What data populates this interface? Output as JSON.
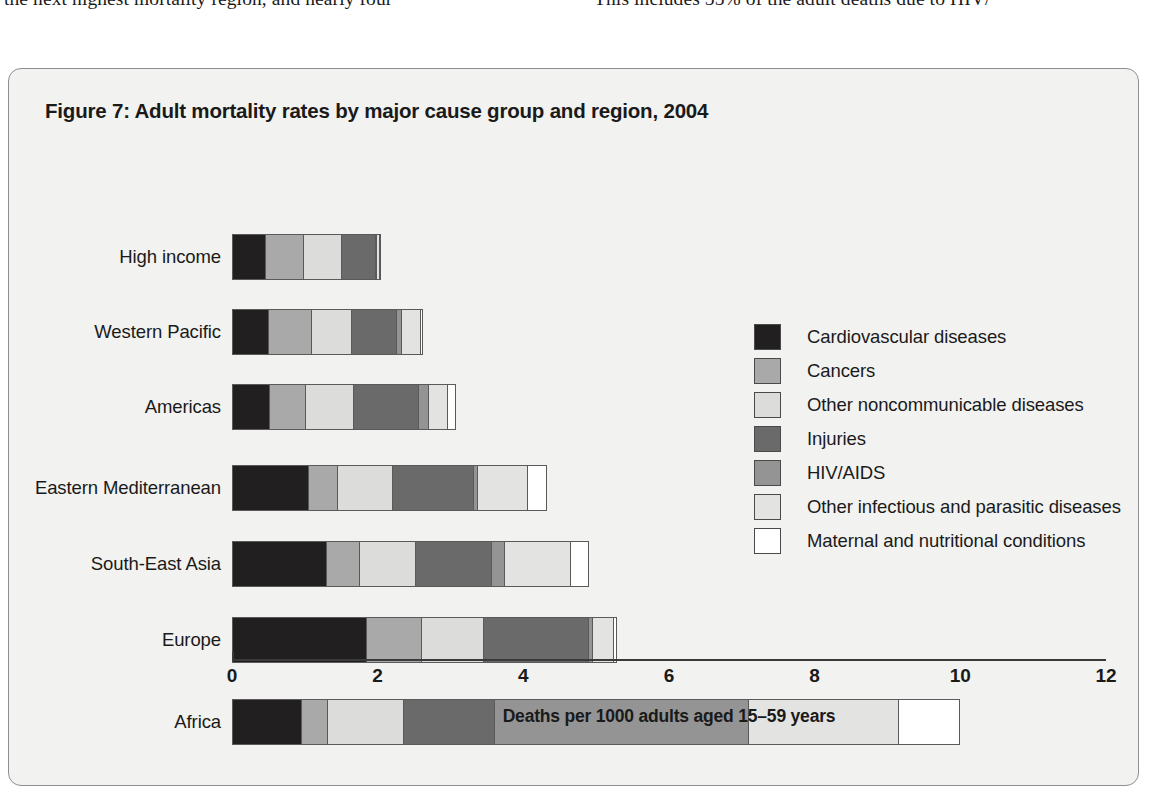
{
  "page_text": {
    "left_column": "the next highest mortality region, and nearly four",
    "right_column": "This includes 55% of the adult deaths due to HIV/"
  },
  "figure": {
    "title": "Figure 7: Adult mortality rates by major cause group and region, 2004"
  },
  "legend": {
    "items": [
      {
        "label": "Cardiovascular diseases",
        "color": "#211f1f"
      },
      {
        "label": "Cancers",
        "color": "#a9a9a9"
      },
      {
        "label": "Other noncommunicable diseases",
        "color": "#dcdcda"
      },
      {
        "label": "Injuries",
        "color": "#6a6a6a"
      },
      {
        "label": "HIV/AIDS",
        "color": "#949494"
      },
      {
        "label": "Other infectious and parasitic diseases",
        "color": "#e3e3e1"
      },
      {
        "label": "Maternal and nutritional conditions",
        "color": "#ffffff"
      }
    ]
  },
  "chart_data": {
    "type": "bar",
    "orientation": "horizontal",
    "stacked": true,
    "title": "Figure 7: Adult mortality rates by major cause group and region, 2004",
    "xlabel": "Deaths per 1000 adults aged 15–59 years",
    "ylabel": "",
    "xlim": [
      0,
      12
    ],
    "xticks": [
      0,
      2,
      4,
      6,
      8,
      10,
      12
    ],
    "xtick_labels": [
      "0",
      "2",
      "4",
      "6",
      "8",
      "10",
      "12"
    ],
    "grid": false,
    "legend_position": "right-middle",
    "categories": [
      "High income",
      "Western Pacific",
      "Americas",
      "Eastern Mediterranean",
      "South-East Asia",
      "Europe",
      "Africa"
    ],
    "series": [
      {
        "name": "Cardiovascular diseases",
        "color": "#211f1f",
        "values": [
          0.46,
          0.5,
          0.51,
          1.05,
          1.3,
          1.85,
          0.95
        ]
      },
      {
        "name": "Cancers",
        "color": "#a9a9a9",
        "values": [
          0.53,
          0.59,
          0.49,
          0.4,
          0.45,
          0.75,
          0.35
        ]
      },
      {
        "name": "Other noncommunicable diseases",
        "color": "#dcdcda",
        "values": [
          0.52,
          0.55,
          0.67,
          0.75,
          0.77,
          0.85,
          1.05
        ]
      },
      {
        "name": "Injuries",
        "color": "#6a6a6a",
        "values": [
          0.47,
          0.63,
          0.89,
          1.12,
          1.05,
          1.45,
          1.25
        ]
      },
      {
        "name": "HIV/AIDS",
        "color": "#949494",
        "values": [
          0.02,
          0.06,
          0.14,
          0.05,
          0.18,
          0.05,
          3.5
        ]
      },
      {
        "name": "Other infectious and parasitic diseases",
        "color": "#e3e3e1",
        "values": [
          0.03,
          0.27,
          0.27,
          0.7,
          0.9,
          0.3,
          2.05
        ]
      },
      {
        "name": "Maternal and nutritional conditions",
        "color": "#ffffff",
        "values": [
          0.01,
          0.02,
          0.1,
          0.25,
          0.25,
          0.03,
          0.85
        ]
      }
    ],
    "totals": [
      2.04,
      2.62,
      3.07,
      4.32,
      4.9,
      5.28,
      10.0
    ]
  }
}
